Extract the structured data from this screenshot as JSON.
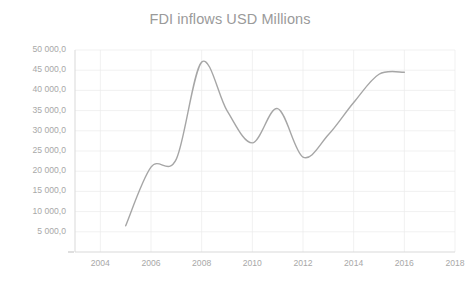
{
  "chart_data": {
    "type": "line",
    "title": "FDI inflows USD Millions",
    "xlabel": "",
    "ylabel": "",
    "grid": true,
    "legend": false,
    "legend_position": "none",
    "xlim": [
      2003,
      2018
    ],
    "ylim": [
      0,
      50000
    ],
    "x_ticks": [
      "2004",
      "2006",
      "2008",
      "2010",
      "2012",
      "2014",
      "2016",
      "2018"
    ],
    "x_tick_values": [
      2004,
      2006,
      2008,
      2010,
      2012,
      2014,
      2016,
      2018
    ],
    "y_ticks": [
      "5 000,0",
      "10 000,0",
      "15 000,0",
      "20 000,0",
      "25 000,0",
      "30 000,0",
      "35 000,0",
      "40 000,0",
      "45 000,0",
      "50 000,0"
    ],
    "y_tick_values": [
      5000,
      10000,
      15000,
      20000,
      25000,
      30000,
      35000,
      40000,
      45000,
      50000
    ],
    "x": [
      2005,
      2006,
      2007,
      2008,
      2009,
      2010,
      2011,
      2012,
      2013,
      2014,
      2015,
      2016
    ],
    "values": [
      6500,
      21000,
      23000,
      47000,
      35000,
      27000,
      35500,
      23500,
      29000,
      37000,
      44000,
      44500
    ],
    "series": [
      {
        "name": "FDI inflows USD Millions",
        "color": "#a6a6a6",
        "values": [
          6500,
          21000,
          23000,
          47000,
          35000,
          27000,
          35500,
          23500,
          29000,
          37000,
          44000,
          44500
        ]
      }
    ],
    "line_color": "#a6a6a6",
    "axis_color": "#d9d9d9",
    "grid_color": "#ebebeb",
    "text_color": "#a8a8a8",
    "title_color": "#9a9a9a",
    "background": "#ffffff"
  }
}
